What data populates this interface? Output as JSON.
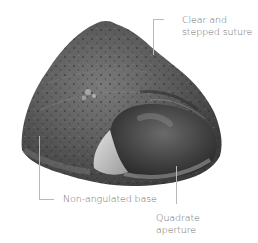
{
  "figure": {
    "labels": {
      "suture": {
        "line1": "Clear and",
        "line2": "stepped suture"
      },
      "base": {
        "text": "Non-angulated base"
      },
      "aperture": {
        "line1": "Quadrate",
        "line2": "aperture"
      }
    },
    "colors": {
      "background": "#ffffff",
      "label_text": "#6e6e6e",
      "leader_line": "#b9b9b9",
      "shell_dark": "#3a3a3a",
      "shell_mid": "#6a6a6a",
      "shell_light": "#a8a8a8",
      "aperture_highlight": "#d9d9d9"
    }
  }
}
